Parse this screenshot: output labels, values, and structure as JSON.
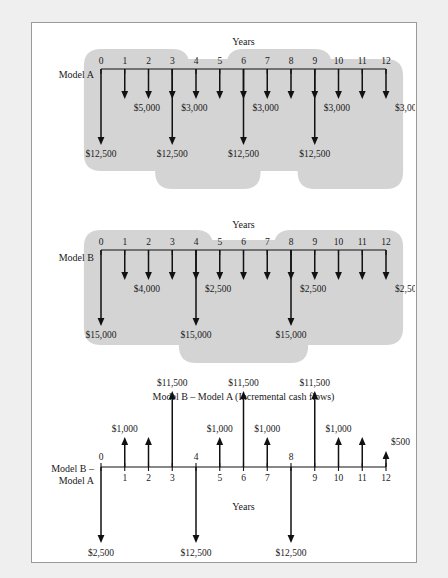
{
  "figure": {
    "background_color": "#efefef",
    "panel_color": "#ffffff",
    "border_color": "#9a9a9a",
    "blob_color": "#d4d4d4",
    "line_color": "#111111"
  },
  "chart_data": {
    "type": "line",
    "xlabel": "Years",
    "ylabel": "",
    "axis_years": [
      0,
      1,
      2,
      3,
      4,
      5,
      6,
      7,
      8,
      9,
      10,
      11,
      12
    ],
    "grid": false,
    "legend": "none",
    "panels": [
      {
        "name": "model-a",
        "side_label": "Model A",
        "axis_title": "Years",
        "tick_labels": [
          "0",
          "1",
          "2",
          "3",
          "4",
          "5",
          "6",
          "7",
          "8",
          "9",
          "10",
          "11",
          "12"
        ],
        "tick_label_position": "above",
        "cycle_length": 3,
        "investment": 12500,
        "annual_cost": 3000,
        "first_year_cost": 5000,
        "flows": [
          {
            "year": 0,
            "amount": -12500,
            "label": "$12,500",
            "magnitude": "large",
            "label_shown": true
          },
          {
            "year": 1,
            "amount": -5000,
            "label": "$5,000",
            "magnitude": "small",
            "label_shown": true
          },
          {
            "year": 2,
            "amount": -5000,
            "label": "",
            "magnitude": "small",
            "label_shown": false
          },
          {
            "year": 3,
            "amount": -3000,
            "label": "$3,000",
            "magnitude": "small",
            "label_shown": true
          },
          {
            "year": 3,
            "amount": -12500,
            "label": "$12,500",
            "magnitude": "large",
            "label_shown": true
          },
          {
            "year": 4,
            "amount": -3000,
            "label": "",
            "magnitude": "small",
            "label_shown": false
          },
          {
            "year": 5,
            "amount": -3000,
            "label": "",
            "magnitude": "small",
            "label_shown": false
          },
          {
            "year": 6,
            "amount": -3000,
            "label": "$3,000",
            "magnitude": "small",
            "label_shown": true
          },
          {
            "year": 6,
            "amount": -12500,
            "label": "$12,500",
            "magnitude": "large",
            "label_shown": true
          },
          {
            "year": 7,
            "amount": -3000,
            "label": "",
            "magnitude": "small",
            "label_shown": false
          },
          {
            "year": 8,
            "amount": -3000,
            "label": "",
            "magnitude": "small",
            "label_shown": false
          },
          {
            "year": 9,
            "amount": -3000,
            "label": "$3,000",
            "magnitude": "small",
            "label_shown": true
          },
          {
            "year": 9,
            "amount": -12500,
            "label": "$12,500",
            "magnitude": "large",
            "label_shown": true
          },
          {
            "year": 10,
            "amount": -3000,
            "label": "",
            "magnitude": "small",
            "label_shown": false
          },
          {
            "year": 11,
            "amount": -3000,
            "label": "",
            "magnitude": "small",
            "label_shown": false
          },
          {
            "year": 12,
            "amount": -3000,
            "label": "$3,000",
            "magnitude": "small",
            "label_shown": true
          }
        ],
        "group_blobs": [
          [
            0,
            3
          ],
          [
            3,
            6
          ],
          [
            6,
            9
          ],
          [
            9,
            12
          ]
        ]
      },
      {
        "name": "model-b",
        "side_label": "Model B",
        "axis_title": "Years",
        "tick_labels": [
          "0",
          "1",
          "2",
          "3",
          "4",
          "5",
          "6",
          "7",
          "8",
          "9",
          "10",
          "11",
          "12"
        ],
        "tick_label_position": "above",
        "cycle_length": 4,
        "investment": 15000,
        "annual_cost": 2500,
        "first_year_cost": 4000,
        "flows": [
          {
            "year": 0,
            "amount": -15000,
            "label": "$15,000",
            "magnitude": "large",
            "label_shown": true
          },
          {
            "year": 1,
            "amount": -4000,
            "label": "$4,000",
            "magnitude": "small",
            "label_shown": true
          },
          {
            "year": 2,
            "amount": -4000,
            "label": "",
            "magnitude": "small",
            "label_shown": false
          },
          {
            "year": 3,
            "amount": -4000,
            "label": "",
            "magnitude": "small",
            "label_shown": false
          },
          {
            "year": 4,
            "amount": -2500,
            "label": "$2,500",
            "magnitude": "small",
            "label_shown": true
          },
          {
            "year": 4,
            "amount": -15000,
            "label": "$15,000",
            "magnitude": "large",
            "label_shown": true
          },
          {
            "year": 5,
            "amount": -2500,
            "label": "",
            "magnitude": "small",
            "label_shown": false
          },
          {
            "year": 6,
            "amount": -2500,
            "label": "",
            "magnitude": "small",
            "label_shown": false
          },
          {
            "year": 7,
            "amount": -2500,
            "label": "",
            "magnitude": "small",
            "label_shown": false
          },
          {
            "year": 8,
            "amount": -2500,
            "label": "$2,500",
            "magnitude": "small",
            "label_shown": true
          },
          {
            "year": 8,
            "amount": -15000,
            "label": "$15,000",
            "magnitude": "large",
            "label_shown": true
          },
          {
            "year": 9,
            "amount": -2500,
            "label": "",
            "magnitude": "small",
            "label_shown": false
          },
          {
            "year": 10,
            "amount": -2500,
            "label": "",
            "magnitude": "small",
            "label_shown": false
          },
          {
            "year": 11,
            "amount": -2500,
            "label": "",
            "magnitude": "small",
            "label_shown": false
          },
          {
            "year": 12,
            "amount": -2500,
            "label": "$2,500",
            "magnitude": "small",
            "label_shown": true
          }
        ],
        "group_blobs": [
          [
            0,
            4
          ],
          [
            4,
            8
          ],
          [
            8,
            12
          ]
        ]
      },
      {
        "name": "incremental",
        "side_label": "Model B –\nModel A",
        "side_label_line1": "Model B –",
        "side_label_line2": "Model A",
        "title": "Model B – Model A (Incremental cash flows)",
        "axis_title": "Years",
        "tick_labels_above": [
          "0",
          "4",
          "8"
        ],
        "tick_labels_below": [
          "1",
          "2",
          "3",
          "5",
          "6",
          "7",
          "9",
          "10",
          "11",
          "12"
        ],
        "flows": [
          {
            "year": 0,
            "amount": -2500,
            "label": "$2,500",
            "magnitude": "large",
            "label_shown": true
          },
          {
            "year": 1,
            "amount": 1000,
            "label": "$1,000",
            "magnitude": "small",
            "label_shown": true
          },
          {
            "year": 2,
            "amount": 1000,
            "label": "",
            "magnitude": "small",
            "label_shown": false
          },
          {
            "year": 3,
            "amount": 11500,
            "label": "$11,500",
            "magnitude": "large",
            "label_shown": true
          },
          {
            "year": 4,
            "amount": -12500,
            "label": "$12,500",
            "magnitude": "large",
            "label_shown": true
          },
          {
            "year": 5,
            "amount": 1000,
            "label": "$1,000",
            "magnitude": "small",
            "label_shown": true
          },
          {
            "year": 6,
            "amount": 11500,
            "label": "$11,500",
            "magnitude": "large",
            "label_shown": true
          },
          {
            "year": 7,
            "amount": 1000,
            "label": "$1,000",
            "magnitude": "small",
            "label_shown": true
          },
          {
            "year": 8,
            "amount": -12500,
            "label": "$12,500",
            "magnitude": "large",
            "label_shown": true
          },
          {
            "year": 9,
            "amount": 11500,
            "label": "$11,500",
            "magnitude": "large",
            "label_shown": true
          },
          {
            "year": 10,
            "amount": 1000,
            "label": "$1,000",
            "magnitude": "small",
            "label_shown": true
          },
          {
            "year": 11,
            "amount": 1000,
            "label": "",
            "magnitude": "small",
            "label_shown": false
          },
          {
            "year": 12,
            "amount": 500,
            "label": "$500",
            "magnitude": "tiny",
            "label_shown": true
          }
        ]
      }
    ]
  }
}
